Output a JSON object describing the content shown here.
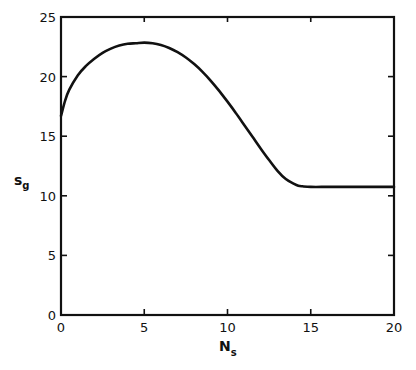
{
  "chart_data": {
    "type": "line",
    "title": "",
    "xlabel": "N",
    "xlabel_subscript": "s",
    "ylabel": "s",
    "ylabel_subscript": "g",
    "xlim": [
      0,
      20
    ],
    "ylim": [
      0,
      25
    ],
    "xticks": [
      0,
      5,
      10,
      15,
      20
    ],
    "yticks": [
      0,
      5,
      10,
      15,
      20,
      25
    ],
    "xtick_labels": [
      "0",
      "5",
      "10",
      "15",
      "20"
    ],
    "ytick_labels": [
      "0",
      "5",
      "10",
      "15",
      "20",
      "25"
    ],
    "grid": false,
    "legend": null,
    "series": [
      {
        "name": "s_g",
        "x": [
          0,
          0.25,
          0.5,
          1,
          1.5,
          2,
          2.5,
          3,
          3.5,
          4,
          4.5,
          5,
          5.5,
          6,
          6.5,
          7,
          7.5,
          8,
          8.5,
          9,
          9.5,
          10,
          10.5,
          11,
          11.5,
          12,
          12.5,
          13,
          13.5,
          14,
          14.25,
          14.5,
          15,
          16,
          17,
          18,
          19,
          20
        ],
        "y": [
          16.7,
          18.0,
          18.9,
          20.1,
          20.9,
          21.5,
          22.0,
          22.35,
          22.6,
          22.75,
          22.8,
          22.85,
          22.8,
          22.65,
          22.4,
          22.05,
          21.6,
          21.05,
          20.4,
          19.65,
          18.8,
          17.9,
          16.95,
          15.95,
          14.95,
          13.95,
          13.0,
          12.1,
          11.4,
          11.0,
          10.85,
          10.8,
          10.75,
          10.75,
          10.75,
          10.75,
          10.75,
          10.75
        ]
      }
    ]
  }
}
